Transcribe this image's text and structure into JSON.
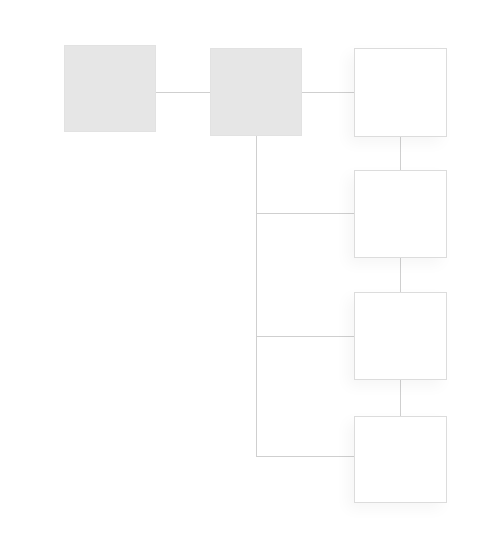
{
  "diagram": {
    "type": "tree",
    "colors": {
      "filled_node": "#e6e6e6",
      "empty_node_fill": "#ffffff",
      "empty_node_border": "#dcdcdc",
      "connector": "#cfcfcf",
      "background": "#ffffff"
    },
    "nodes": [
      {
        "id": "A",
        "style": "filled",
        "label": "",
        "x": 64,
        "y": 45,
        "w": 92,
        "h": 87
      },
      {
        "id": "B",
        "style": "filled",
        "label": "",
        "x": 210,
        "y": 48,
        "w": 92,
        "h": 88
      },
      {
        "id": "C",
        "style": "empty",
        "label": "",
        "x": 354,
        "y": 48,
        "w": 93,
        "h": 89
      },
      {
        "id": "D",
        "style": "empty",
        "label": "",
        "x": 354,
        "y": 170,
        "w": 93,
        "h": 88
      },
      {
        "id": "E",
        "style": "empty",
        "label": "",
        "x": 354,
        "y": 292,
        "w": 93,
        "h": 88
      },
      {
        "id": "F",
        "style": "empty",
        "label": "",
        "x": 354,
        "y": 416,
        "w": 93,
        "h": 87
      }
    ],
    "edges": [
      {
        "from": "A",
        "to": "B"
      },
      {
        "from": "B",
        "to": "C"
      },
      {
        "from": "B",
        "to": "D"
      },
      {
        "from": "B",
        "to": "E"
      },
      {
        "from": "B",
        "to": "F"
      },
      {
        "from": "C",
        "to": "D"
      },
      {
        "from": "D",
        "to": "E"
      },
      {
        "from": "E",
        "to": "F"
      }
    ],
    "lines": [
      {
        "name": "connector-a-b",
        "x": 156,
        "y": 92,
        "w": 54,
        "h": 1
      },
      {
        "name": "connector-b-c",
        "x": 302,
        "y": 92,
        "w": 52,
        "h": 1
      },
      {
        "name": "trunk-b-down",
        "x": 256,
        "y": 136,
        "w": 1,
        "h": 321
      },
      {
        "name": "branch-to-d",
        "x": 256,
        "y": 213,
        "w": 98,
        "h": 1
      },
      {
        "name": "branch-to-e",
        "x": 256,
        "y": 336,
        "w": 98,
        "h": 1
      },
      {
        "name": "branch-to-f",
        "x": 256,
        "y": 456,
        "w": 98,
        "h": 1
      },
      {
        "name": "connector-c-d",
        "x": 400,
        "y": 137,
        "w": 1,
        "h": 33
      },
      {
        "name": "connector-d-e",
        "x": 400,
        "y": 258,
        "w": 1,
        "h": 34
      },
      {
        "name": "connector-e-f",
        "x": 400,
        "y": 380,
        "w": 1,
        "h": 36
      }
    ]
  }
}
